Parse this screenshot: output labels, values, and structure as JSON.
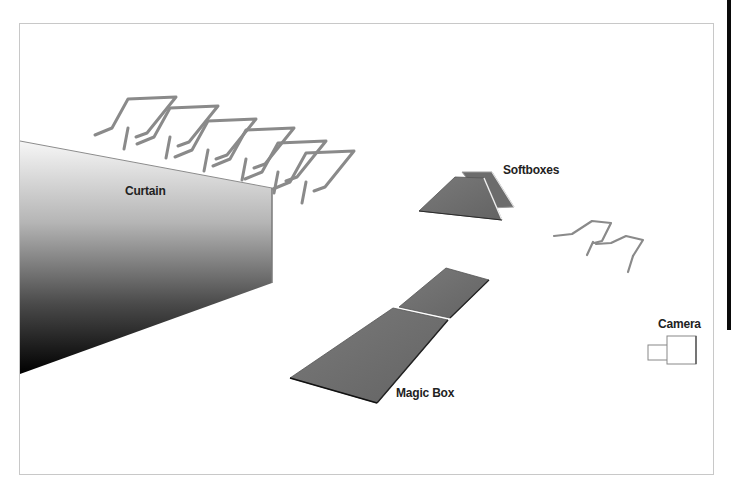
{
  "diagram": {
    "type": "studio-lighting-setup",
    "labels": {
      "curtain": "Curtain",
      "softboxes": "Softboxes",
      "magic_box": "Magic Box",
      "camera": "Camera"
    },
    "elements": [
      {
        "id": "curtain",
        "label": "Curtain",
        "shape": "gradient-wall"
      },
      {
        "id": "background-lights",
        "label": "",
        "shape": "light-stands",
        "count": 6
      },
      {
        "id": "softboxes",
        "label": "Softboxes",
        "shape": "trapezoid-panels",
        "count": 2
      },
      {
        "id": "front-lights",
        "label": "",
        "shape": "light-stands",
        "count": 2
      },
      {
        "id": "magic-box",
        "label": "Magic Box",
        "shape": "floor-panels",
        "count": 2
      },
      {
        "id": "camera",
        "label": "Camera",
        "shape": "camera-outline"
      }
    ],
    "colors": {
      "frame_border": "#c8c8c8",
      "panel_fill": "#6e6e6e",
      "stand_stroke": "#8a8a8a",
      "curtain_top": "#f4f4f4",
      "curtain_bottom": "#000000",
      "label_text": "#222222"
    }
  }
}
